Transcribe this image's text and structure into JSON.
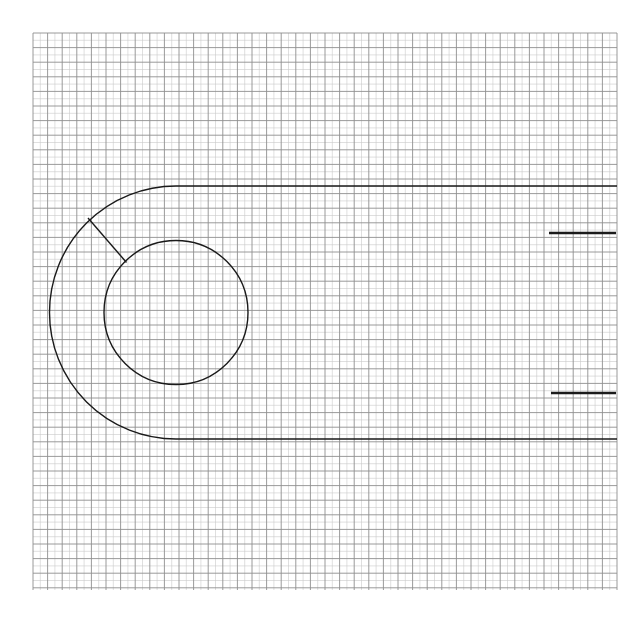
{
  "document": {
    "type": "engineering-drawing",
    "title": "Crank arm profile on graph paper",
    "background_color": "#ffffff",
    "canvas": {
      "width": 627,
      "height": 626
    }
  },
  "grid": {
    "name": "graph-paper-grid",
    "origin_x": 33,
    "origin_y": 33,
    "end_x": 617,
    "end_y": 590,
    "minor_spacing": 7.3,
    "major_every": 2,
    "minor_color": "#c9c9c9",
    "major_color": "#8e8e8e",
    "minor_width": 0.6,
    "major_width": 0.9,
    "columns": 80,
    "rows": 76
  },
  "geometry": {
    "outline_color": "#1a1a1a",
    "outline_width": 1.4,
    "arm": {
      "name": "crank-arm-outline",
      "top_edge_y": 186,
      "bottom_edge_y": 439,
      "right_edge_x": 617,
      "fillet_center_x": 176,
      "fillet_center_y": 312.5,
      "outer_radius": 126,
      "tangent_x": 176
    },
    "boss_hole": {
      "name": "center-bore-circle",
      "center_x": 176,
      "center_y": 312.5,
      "radius": 72,
      "diameter": 144
    },
    "radial_line": {
      "name": "radius-construction-line",
      "x1": 88,
      "y1": 218,
      "x2": 126.5,
      "y2": 262.5
    },
    "reference_marks": [
      {
        "name": "upper-reference-dash",
        "x1": 549,
        "y1": 233,
        "x2": 616,
        "y2": 233,
        "width": 2.4,
        "color": "#1a1a1a"
      },
      {
        "name": "lower-reference-dash",
        "x1": 551,
        "y1": 393,
        "x2": 616,
        "y2": 393,
        "width": 2.4,
        "color": "#1a1a1a"
      }
    ]
  },
  "chart_data": {
    "type": "scatter",
    "xlabel": "",
    "ylabel": "",
    "xlim": [
      33,
      617
    ],
    "ylim": [
      33,
      590
    ],
    "grid": true,
    "legend": "none",
    "annotations": [
      "outer arm outline with 126 px fillet radius",
      "center bore circle radius 72 px at (176, 312.5)",
      "radial construction line from outer arc to bore",
      "two horizontal reference dashes at right margin"
    ],
    "series": [
      {
        "name": "arm-top-edge",
        "x": [
          176,
          617
        ],
        "values": [
          186,
          186
        ]
      },
      {
        "name": "arm-bottom-edge",
        "x": [
          176,
          617
        ],
        "values": [
          439,
          439
        ]
      },
      {
        "name": "bore-center",
        "x": [
          176
        ],
        "values": [
          312.5
        ]
      },
      {
        "name": "upper-reference-dash",
        "x": [
          549,
          616
        ],
        "values": [
          233,
          233
        ]
      },
      {
        "name": "lower-reference-dash",
        "x": [
          551,
          616
        ],
        "values": [
          393,
          393
        ]
      }
    ]
  }
}
